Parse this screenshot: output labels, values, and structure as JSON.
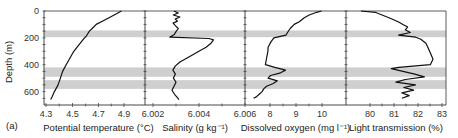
{
  "figure": {
    "panel_label": "(a)",
    "y_axis_label": "Depth (m)",
    "band_color": "#cfcfcf",
    "line_color": "#111111"
  },
  "chart_data": [
    {
      "type": "line",
      "title": "",
      "xlabel": "Potential temperature (°C)",
      "ylabel": "Depth (m)",
      "xlim": [
        4.3,
        4.95
      ],
      "ylim": [
        700,
        0
      ],
      "xticks": [
        "4.3",
        "4.5",
        "4.7",
        "4.9"
      ],
      "yticks": [
        "0",
        "200",
        "400",
        "600"
      ],
      "grid": false,
      "depth": [
        0,
        20,
        50,
        80,
        100,
        130,
        150,
        170,
        190,
        200,
        250,
        300,
        350,
        400,
        450,
        500,
        550,
        600,
        640,
        660
      ],
      "values": [
        4.88,
        4.84,
        4.78,
        4.72,
        4.68,
        4.65,
        4.63,
        4.62,
        4.61,
        4.6,
        4.56,
        4.52,
        4.49,
        4.46,
        4.43,
        4.41,
        4.39,
        4.36,
        4.34,
        4.33
      ]
    },
    {
      "type": "line",
      "title": "",
      "xlabel": "Salinity (g kg⁻¹)",
      "ylabel": "Depth (m)",
      "xlim": [
        6.0019,
        6.0062
      ],
      "ylim": [
        700,
        0
      ],
      "xticks": [
        "6.002",
        "6.004",
        "6.006"
      ],
      "grid": false,
      "depth": [
        0,
        15,
        30,
        45,
        60,
        75,
        90,
        110,
        130,
        150,
        175,
        195,
        205,
        215,
        240,
        270,
        300,
        340,
        380,
        410,
        440,
        470,
        500,
        530,
        560,
        590,
        620,
        640,
        660
      ],
      "values": [
        6.0029,
        6.0031,
        6.0029,
        6.0032,
        6.003,
        6.0031,
        6.0029,
        6.003,
        6.0031,
        6.003,
        6.0029,
        6.0027,
        6.0044,
        6.0046,
        6.0045,
        6.0043,
        6.004,
        6.0036,
        6.0032,
        6.003,
        6.0029,
        6.003,
        6.0029,
        6.003,
        6.0029,
        6.0028,
        6.0029,
        6.003,
        6.0031
      ]
    },
    {
      "type": "line",
      "title": "",
      "xlabel": "Dissolved oxygen (mg l⁻¹)",
      "ylabel": "Depth (m)",
      "xlim": [
        7.0,
        11.0
      ],
      "ylim": [
        700,
        0
      ],
      "xticks": [
        "8",
        "9",
        "10"
      ],
      "grid": false,
      "depth": [
        0,
        10,
        30,
        50,
        80,
        100,
        130,
        160,
        180,
        200,
        230,
        270,
        300,
        350,
        400,
        420,
        440,
        460,
        480,
        500,
        520,
        540,
        560,
        580,
        600,
        620,
        640,
        650
      ],
      "values": [
        10.0,
        9.8,
        9.5,
        9.3,
        9.1,
        8.9,
        8.75,
        8.65,
        8.6,
        8.15,
        8.05,
        7.95,
        7.95,
        7.9,
        7.85,
        8.2,
        8.6,
        8.4,
        8.0,
        7.9,
        8.25,
        8.1,
        7.85,
        7.75,
        7.7,
        7.6,
        7.5,
        7.4
      ]
    },
    {
      "type": "line",
      "title": "",
      "xlabel": "Light transmission (%)",
      "ylabel": "Depth (m)",
      "xlim": [
        79.0,
        83.1
      ],
      "ylim": [
        700,
        0
      ],
      "xticks": [
        "80",
        "81",
        "82",
        "83"
      ],
      "grid": false,
      "depth": [
        0,
        10,
        30,
        50,
        80,
        100,
        120,
        140,
        160,
        180,
        195,
        210,
        240,
        280,
        320,
        360,
        400,
        420,
        430,
        450,
        470,
        490,
        510,
        530,
        550,
        570,
        590,
        610,
        630,
        650
      ],
      "values": [
        79.6,
        80.2,
        80.5,
        80.8,
        81.2,
        81.4,
        81.6,
        81.5,
        81.7,
        81.2,
        81.9,
        82.1,
        82.3,
        82.4,
        82.5,
        82.6,
        82.5,
        81.2,
        80.9,
        81.4,
        81.9,
        82.3,
        81.5,
        81.1,
        81.9,
        81.4,
        81.8,
        81.3,
        81.6,
        81.3
      ]
    }
  ],
  "highlight_bands": [
    {
      "depth_top": 145,
      "depth_bottom": 195
    },
    {
      "depth_top": 420,
      "depth_bottom": 490
    },
    {
      "depth_top": 515,
      "depth_bottom": 580
    }
  ]
}
